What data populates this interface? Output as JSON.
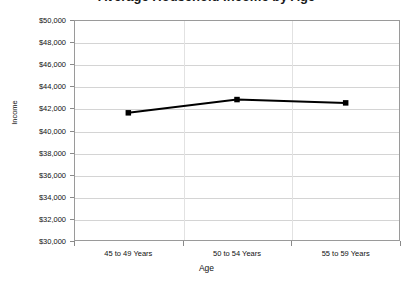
{
  "chart_data": {
    "type": "line",
    "title": "Average Household Income by Age",
    "xlabel": "Age",
    "ylabel": "Income",
    "categories": [
      "45 to 49 Years",
      "50 to 54 Years",
      "55 to 59 Years"
    ],
    "values": [
      41600,
      42800,
      42500
    ],
    "series": [
      {
        "name": "Income",
        "values": [
          41600,
          42800,
          42500
        ]
      }
    ],
    "ylim": [
      30000,
      50000
    ],
    "ytick_step": 2000,
    "ytick_labels": [
      "$50,000",
      "$48,000",
      "$46,000",
      "$44,000",
      "$42,000",
      "$40,000",
      "$38,000",
      "$36,000",
      "$34,000",
      "$32,000",
      "$30,000"
    ],
    "ytick_values": [
      50000,
      48000,
      46000,
      44000,
      42000,
      40000,
      38000,
      36000,
      34000,
      32000,
      30000
    ],
    "grid": true,
    "legend": false,
    "legend_position": "none",
    "line_color": "#000000",
    "marker_color": "#000000",
    "marker_shape": "square",
    "plot_background": "#ffffff",
    "grid_color": "#d4d4d4",
    "axis_color": "#9a9a9a"
  }
}
